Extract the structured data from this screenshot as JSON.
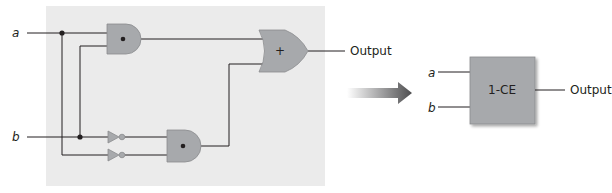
{
  "figure": {
    "left_circuit": {
      "inputs": [
        {
          "name": "a",
          "label": "a"
        },
        {
          "name": "b",
          "label": "b"
        }
      ],
      "gates": [
        {
          "id": "and1",
          "type": "AND",
          "symbol": "•"
        },
        {
          "id": "and2",
          "type": "AND",
          "symbol": "•"
        },
        {
          "id": "not1",
          "type": "NOT"
        },
        {
          "id": "not2",
          "type": "NOT"
        },
        {
          "id": "or1",
          "type": "OR",
          "symbol": "+"
        }
      ],
      "output_label": "Output"
    },
    "arrow": {
      "direction": "right"
    },
    "right_block": {
      "label": "1-CE",
      "inputs": [
        "a",
        "b"
      ],
      "output_label": "Output"
    },
    "colors": {
      "panel": "#ebebeb",
      "gate_fill": "#a7a9ac",
      "box_fill": "#a7a9ac",
      "wire": "#231f20",
      "arrow_dark": "#4d4d4f"
    }
  }
}
